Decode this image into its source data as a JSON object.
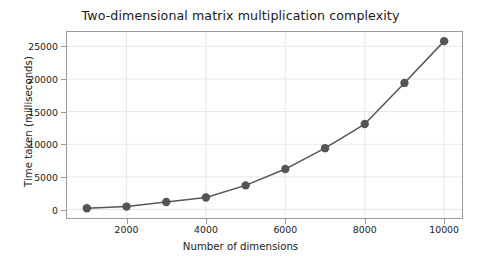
{
  "chart_data": {
    "type": "line",
    "title": "Two-dimensional matrix multiplication complexity",
    "xlabel": "Number of dimensions",
    "ylabel": "Time taken (milliseconds)",
    "x": [
      1000,
      2000,
      3000,
      4000,
      5000,
      6000,
      7000,
      8000,
      9000,
      10000
    ],
    "values": [
      200,
      450,
      1150,
      1850,
      3700,
      6200,
      9400,
      13100,
      19400,
      25800
    ],
    "series": [
      {
        "name": "Time taken",
        "values": [
          200,
          450,
          1150,
          1850,
          3700,
          6200,
          9400,
          13100,
          19400,
          25800
        ]
      }
    ],
    "xlim": [
      500,
      10450
    ],
    "ylim": [
      -1300,
      27200
    ],
    "xticks": [
      2000,
      4000,
      6000,
      8000,
      10000
    ],
    "xtick_labels": [
      "2000",
      "4000",
      "6000",
      "8000",
      "10000"
    ],
    "yticks": [
      0,
      5000,
      10000,
      15000,
      20000,
      25000
    ],
    "ytick_labels": [
      "0",
      "5000",
      "10000",
      "15000",
      "20000",
      "25000"
    ],
    "grid": true,
    "legend": null,
    "line_color": "#555555",
    "marker_color": "#555555",
    "marker": "circle",
    "grid_color": "#e8e8e8",
    "axis_color": "#9a9a9a",
    "background": "#ffffff"
  }
}
